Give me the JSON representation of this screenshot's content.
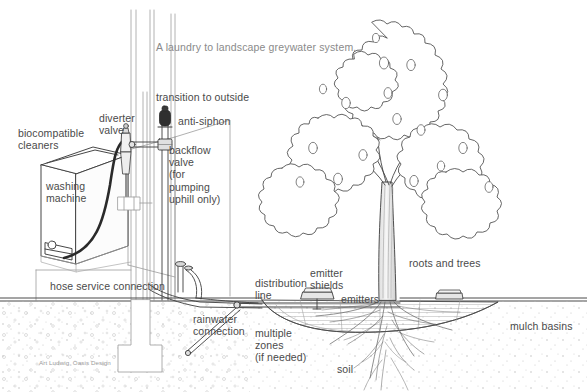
{
  "page": {
    "width": 587,
    "height": 392,
    "background": "#ffffff",
    "line_color": "#3a3a3a",
    "text_color": "#4a4a4a",
    "title_color": "#8a8a8a",
    "credit_color": "#9a9a9a"
  },
  "title": "A laundry to landscape greywater system.",
  "credit": "Art Ludwig, Oasis Design",
  "labels": [
    {
      "id": "biocompatible-cleaners",
      "text": "biocompatible\ncleaners",
      "x": 18,
      "y": 127,
      "align": "left"
    },
    {
      "id": "washing-machine",
      "text": "washing\nmachine",
      "x": 46,
      "y": 180,
      "align": "left"
    },
    {
      "id": "diverter-valve",
      "text": "diverter\nvalve",
      "x": 99,
      "y": 112,
      "align": "left"
    },
    {
      "id": "transition-to-outside",
      "text": "transition to outside",
      "x": 156,
      "y": 91,
      "align": "left"
    },
    {
      "id": "anti-siphon",
      "text": "anti-siphon",
      "x": 178,
      "y": 115,
      "align": "left"
    },
    {
      "id": "backflow-valve",
      "text": "backflow\nvalve\n(for\npumping\nuphill only)",
      "x": 169,
      "y": 144,
      "align": "left"
    },
    {
      "id": "hose-service-connection",
      "text": "hose service connection",
      "x": 50,
      "y": 280,
      "align": "left"
    },
    {
      "id": "rainwater-connection",
      "text": "rainwater\nconnection",
      "x": 193,
      "y": 313,
      "align": "left"
    },
    {
      "id": "distribution-line",
      "text": "distribution\nline",
      "x": 255,
      "y": 277,
      "align": "left"
    },
    {
      "id": "multiple-zones",
      "text": "multiple\nzones\n(if needed)",
      "x": 255,
      "y": 327,
      "align": "left"
    },
    {
      "id": "emitter-shields",
      "text": "emitter\nshields",
      "x": 310,
      "y": 267,
      "align": "left"
    },
    {
      "id": "emitters",
      "text": "emitters",
      "x": 341,
      "y": 293,
      "align": "left"
    },
    {
      "id": "soil",
      "text": "soil",
      "x": 337,
      "y": 363,
      "align": "left"
    },
    {
      "id": "roots-and-trees",
      "text": "roots and trees",
      "x": 409,
      "y": 257,
      "align": "left"
    },
    {
      "id": "mulch-basins",
      "text": "mulch basins",
      "x": 510,
      "y": 320,
      "align": "left"
    }
  ],
  "diagram_elements": {
    "wall": "vertical house wall at x=128-175",
    "washing_machine": "isometric box, left of wall",
    "diverter_valve": "small valve on wall at top of drain hose",
    "anti_siphon": "dark capsule atop vertical riser",
    "backflow_valve": "tee fitting on riser",
    "ground_line": "horizontal soil surface near y=298",
    "tree": "deciduous fruit tree with canopy and root mass, right side",
    "mulch_basin": "hatched shallow basin around tree",
    "distribution_line": "buried lateral pipe with emitters"
  }
}
